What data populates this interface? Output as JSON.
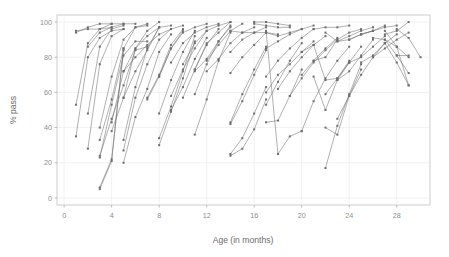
{
  "chart_data": {
    "type": "line",
    "title": "",
    "subtitle": "",
    "xlabel": "Age (in months)",
    "ylabel": "% pass",
    "xlim": [
      -0.6,
      30.8
    ],
    "ylim": [
      -4,
      104
    ],
    "xticks": [
      0,
      4,
      8,
      12,
      16,
      20,
      24,
      28
    ],
    "yticks": [
      0,
      20,
      40,
      60,
      80,
      100
    ],
    "xtick_labels": [
      "0",
      "4",
      "8",
      "12",
      "16",
      "20",
      "24",
      "28"
    ],
    "ytick_labels": [
      "0",
      "20",
      "40",
      "60",
      "80",
      "100"
    ],
    "grid": true,
    "grid_color": "#ebebf2",
    "panel_background": "#ffffff",
    "panel_border_color": "#d9d9d9",
    "legend": "none",
    "marker": "square",
    "marker_size": 2.0,
    "line_color": "#6e6e6e",
    "line_width": 0.55,
    "series": [
      {
        "name": "m01",
        "x": [
          1,
          2,
          3,
          4,
          5
        ],
        "values": [
          35,
          80,
          91,
          95,
          96
        ]
      },
      {
        "name": "m02",
        "x": [
          1,
          2,
          3,
          4,
          5
        ],
        "values": [
          53,
          88,
          96,
          99,
          99
        ]
      },
      {
        "name": "m03",
        "x": [
          1,
          2,
          3,
          4
        ],
        "values": [
          94,
          97,
          99,
          99
        ]
      },
      {
        "name": "m04",
        "x": [
          1,
          2,
          3,
          4
        ],
        "values": [
          95,
          96,
          96,
          97
        ]
      },
      {
        "name": "m05",
        "x": [
          2,
          3,
          4,
          5
        ],
        "values": [
          28,
          76,
          92,
          96
        ]
      },
      {
        "name": "m06",
        "x": [
          2,
          3,
          4,
          5
        ],
        "values": [
          48,
          86,
          96,
          98
        ]
      },
      {
        "name": "m07",
        "x": [
          2,
          3,
          4,
          5,
          6
        ],
        "values": [
          86,
          94,
          97,
          99,
          99
        ]
      },
      {
        "name": "m08",
        "x": [
          3,
          4,
          5,
          6,
          7
        ],
        "values": [
          23,
          53,
          81,
          89,
          89
        ]
      },
      {
        "name": "m09",
        "x": [
          3,
          4,
          5,
          6,
          7
        ],
        "values": [
          24,
          45,
          64,
          84,
          86
        ]
      },
      {
        "name": "m10",
        "x": [
          3,
          4,
          5,
          6,
          7
        ],
        "values": [
          33,
          56,
          85,
          97,
          98
        ]
      },
      {
        "name": "m11",
        "x": [
          3,
          4,
          5,
          6,
          7
        ],
        "values": [
          40,
          69,
          90,
          97,
          99
        ]
      },
      {
        "name": "m12",
        "x": [
          3,
          4,
          5
        ],
        "values": [
          5,
          21,
          84
        ]
      },
      {
        "name": "m13",
        "x": [
          3,
          4,
          5
        ],
        "values": [
          6,
          22,
          85
        ]
      },
      {
        "name": "m14",
        "x": [
          4,
          5,
          6,
          7,
          8
        ],
        "values": [
          38,
          57,
          72,
          84,
          97
        ]
      },
      {
        "name": "m15",
        "x": [
          4,
          5,
          6,
          7,
          8
        ],
        "values": [
          43,
          72,
          85,
          92,
          97
        ]
      },
      {
        "name": "m16",
        "x": [
          5,
          6,
          7,
          8,
          9
        ],
        "values": [
          20,
          46,
          62,
          83,
          93
        ]
      },
      {
        "name": "m17",
        "x": [
          5,
          6,
          7,
          8,
          9
        ],
        "values": [
          27,
          57,
          76,
          90,
          96
        ]
      },
      {
        "name": "m18",
        "x": [
          5,
          6,
          7,
          8,
          9
        ],
        "values": [
          33,
          63,
          85,
          97,
          98
        ]
      },
      {
        "name": "m19",
        "x": [
          5,
          6,
          7,
          8
        ],
        "values": [
          57,
          85,
          95,
          100
        ]
      },
      {
        "name": "m20",
        "x": [
          7,
          8,
          9,
          10
        ],
        "values": [
          56,
          69,
          85,
          95
        ]
      },
      {
        "name": "m21",
        "x": [
          7,
          8,
          9,
          10
        ],
        "values": [
          57,
          70,
          87,
          96
        ]
      },
      {
        "name": "m22",
        "x": [
          8,
          9,
          10,
          11
        ],
        "values": [
          30,
          49,
          68,
          89
        ]
      },
      {
        "name": "m23",
        "x": [
          8,
          9,
          10,
          11
        ],
        "values": [
          34,
          52,
          72,
          92
        ]
      },
      {
        "name": "m24",
        "x": [
          8,
          9,
          10,
          11
        ],
        "values": [
          48,
          67,
          83,
          95
        ]
      },
      {
        "name": "m25",
        "x": [
          8,
          9,
          10,
          11,
          12
        ],
        "values": [
          69,
          85,
          94,
          97,
          99
        ]
      },
      {
        "name": "m26",
        "x": [
          9,
          10,
          11,
          12
        ],
        "values": [
          50,
          63,
          79,
          91
        ]
      },
      {
        "name": "m27",
        "x": [
          9,
          10,
          11,
          12
        ],
        "values": [
          58,
          73,
          85,
          95
        ]
      },
      {
        "name": "m28",
        "x": [
          10,
          11,
          12,
          13
        ],
        "values": [
          57,
          73,
          87,
          96
        ]
      },
      {
        "name": "m29",
        "x": [
          10,
          11,
          12,
          13,
          14
        ],
        "values": [
          76,
          88,
          95,
          98,
          100
        ]
      },
      {
        "name": "m30",
        "x": [
          11,
          12,
          13,
          14
        ],
        "values": [
          36,
          56,
          78,
          94
        ]
      },
      {
        "name": "m31",
        "x": [
          11,
          12,
          13,
          14
        ],
        "values": [
          59,
          76,
          89,
          97
        ]
      },
      {
        "name": "m32",
        "x": [
          11,
          12,
          13,
          14
        ],
        "values": [
          72,
          79,
          89,
          98
        ]
      },
      {
        "name": "m33",
        "x": [
          11,
          12,
          13,
          14
        ],
        "values": [
          73,
          88,
          94,
          100
        ]
      },
      {
        "name": "m34",
        "x": [
          12,
          13,
          14,
          15
        ],
        "values": [
          78,
          87,
          95,
          99
        ]
      },
      {
        "name": "m35",
        "x": [
          14,
          15,
          16,
          17
        ],
        "values": [
          24,
          28,
          39,
          56
        ]
      },
      {
        "name": "m36",
        "x": [
          14,
          15,
          16,
          17
        ],
        "values": [
          25,
          34,
          48,
          63
        ]
      },
      {
        "name": "m37",
        "x": [
          14,
          15,
          16,
          17
        ],
        "values": [
          42,
          55,
          70,
          84
        ]
      },
      {
        "name": "m38",
        "x": [
          14,
          15,
          16,
          17
        ],
        "values": [
          43,
          59,
          73,
          86
        ]
      },
      {
        "name": "m39",
        "x": [
          14,
          15,
          16,
          17
        ],
        "values": [
          71,
          80,
          87,
          94
        ]
      },
      {
        "name": "m40",
        "x": [
          14,
          15,
          16,
          17
        ],
        "values": [
          83,
          90,
          94,
          97
        ]
      },
      {
        "name": "m41",
        "x": [
          14,
          15,
          16,
          17,
          18
        ],
        "values": [
          95,
          94,
          94,
          94,
          93
        ]
      },
      {
        "name": "m42",
        "x": [
          16,
          17,
          18,
          19
        ],
        "values": [
          99,
          98,
          97,
          97
        ]
      },
      {
        "name": "m43",
        "x": [
          16,
          17,
          18,
          19
        ],
        "values": [
          100,
          100,
          99,
          98
        ]
      },
      {
        "name": "m44",
        "x": [
          17,
          18,
          19,
          20
        ],
        "values": [
          43,
          44,
          58,
          73
        ]
      },
      {
        "name": "m45",
        "x": [
          17,
          18,
          19,
          20
        ],
        "values": [
          53,
          66,
          78,
          88
        ]
      },
      {
        "name": "m46",
        "x": [
          17,
          18,
          19,
          20,
          21
        ],
        "values": [
          60,
          70,
          76,
          83,
          89
        ]
      },
      {
        "name": "m47",
        "x": [
          17,
          18,
          19,
          20,
          21
        ],
        "values": [
          69,
          78,
          85,
          91,
          96
        ]
      },
      {
        "name": "m48",
        "x": [
          17,
          18,
          19,
          20,
          21
        ],
        "values": [
          85,
          89,
          93,
          96,
          98
        ]
      },
      {
        "name": "m49",
        "x": [
          17,
          18,
          19,
          20
        ],
        "values": [
          94,
          92,
          94,
          96
        ]
      },
      {
        "name": "m50",
        "x": [
          17,
          18,
          19,
          20
        ],
        "values": [
          95,
          25,
          35,
          38
        ]
      },
      {
        "name": "m51",
        "x": [
          20,
          21,
          22,
          23
        ],
        "values": [
          70,
          78,
          85,
          91
        ]
      },
      {
        "name": "m52",
        "x": [
          20,
          21,
          22,
          23,
          24
        ],
        "values": [
          83,
          87,
          67,
          68,
          78
        ]
      },
      {
        "name": "m53",
        "x": [
          21,
          22,
          23,
          24
        ],
        "values": [
          69,
          50,
          67,
          77
        ]
      },
      {
        "name": "m54",
        "x": [
          21,
          22,
          23,
          24,
          25
        ],
        "values": [
          78,
          80,
          90,
          94,
          96
        ]
      },
      {
        "name": "m55",
        "x": [
          21,
          22,
          23,
          24
        ],
        "values": [
          96,
          97,
          97,
          98
        ]
      },
      {
        "name": "m56",
        "x": [
          22,
          23,
          24,
          25
        ],
        "values": [
          17,
          41,
          59,
          76
        ]
      },
      {
        "name": "m57",
        "x": [
          22,
          23,
          24,
          25
        ],
        "values": [
          40,
          36,
          58,
          73
        ]
      },
      {
        "name": "m58",
        "x": [
          22,
          23,
          24,
          25
        ],
        "values": [
          59,
          68,
          77,
          86
        ]
      },
      {
        "name": "m59",
        "x": [
          22,
          23,
          24,
          25,
          26
        ],
        "values": [
          94,
          89,
          90,
          93,
          95
        ]
      },
      {
        "name": "m60",
        "x": [
          23,
          24,
          25,
          26
        ],
        "values": [
          67,
          72,
          81,
          90
        ]
      },
      {
        "name": "m61",
        "x": [
          23,
          24,
          25,
          26
        ],
        "values": [
          89,
          92,
          95,
          97
        ]
      },
      {
        "name": "m62",
        "x": [
          24,
          25,
          26,
          27
        ],
        "values": [
          77,
          80,
          86,
          92
        ]
      },
      {
        "name": "m63",
        "x": [
          24,
          25,
          26,
          27
        ],
        "values": [
          90,
          93,
          95,
          98
        ]
      },
      {
        "name": "m64",
        "x": [
          25,
          26,
          27,
          28
        ],
        "values": [
          77,
          81,
          88,
          93
        ]
      },
      {
        "name": "m65",
        "x": [
          25,
          26,
          27,
          28
        ],
        "values": [
          93,
          95,
          97,
          98
        ]
      },
      {
        "name": "m66",
        "x": [
          26,
          27,
          28,
          29
        ],
        "values": [
          80,
          85,
          90,
          94
        ]
      },
      {
        "name": "m67",
        "x": [
          26,
          27,
          28,
          29
        ],
        "values": [
          91,
          90,
          86,
          80
        ]
      },
      {
        "name": "m68",
        "x": [
          27,
          28,
          29
        ],
        "values": [
          93,
          95,
          100
        ]
      },
      {
        "name": "m69",
        "x": [
          27,
          28,
          29
        ],
        "values": [
          88,
          77,
          64
        ]
      },
      {
        "name": "m70",
        "x": [
          27,
          28,
          29
        ],
        "values": [
          90,
          81,
          71
        ]
      },
      {
        "name": "m71",
        "x": [
          27,
          28,
          29
        ],
        "values": [
          95,
          86,
          64
        ]
      },
      {
        "name": "m72",
        "x": [
          28,
          29,
          30
        ],
        "values": [
          96,
          91,
          80
        ]
      },
      {
        "name": "m73",
        "x": [
          28,
          29
        ],
        "values": [
          81,
          81
        ]
      },
      {
        "name": "m74",
        "x": [
          5,
          6,
          7,
          8,
          9,
          10
        ],
        "values": [
          72,
          80,
          87,
          93,
          96,
          98
        ]
      },
      {
        "name": "m75",
        "x": [
          9,
          10,
          11,
          12,
          13
        ],
        "values": [
          77,
          88,
          94,
          97,
          99
        ]
      },
      {
        "name": "m76",
        "x": [
          12,
          13,
          14,
          15,
          16
        ],
        "values": [
          72,
          79,
          88,
          94,
          97
        ]
      },
      {
        "name": "m77",
        "x": [
          18,
          19,
          20,
          21,
          22
        ],
        "values": [
          62,
          72,
          80,
          87,
          92
        ]
      },
      {
        "name": "m78",
        "x": [
          19,
          20,
          21,
          22,
          23
        ],
        "values": [
          58,
          68,
          77,
          84,
          90
        ]
      },
      {
        "name": "m79",
        "x": [
          20,
          21,
          22,
          23,
          24
        ],
        "values": [
          38,
          55,
          68,
          78,
          86
        ]
      },
      {
        "name": "m80",
        "x": [
          23,
          24,
          25,
          26,
          27
        ],
        "values": [
          45,
          58,
          70,
          80,
          88
        ]
      }
    ]
  },
  "axes": {
    "ylabel": "% pass",
    "xlabel": "Age (in months)"
  }
}
